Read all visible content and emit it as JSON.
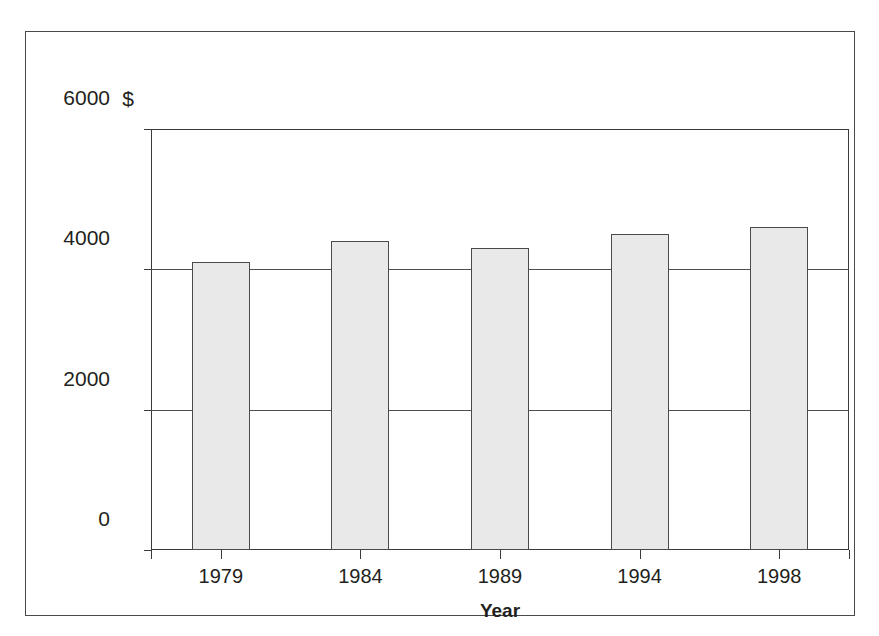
{
  "chart_data": {
    "type": "bar",
    "title": "",
    "subtitle": "",
    "xlabel": "Year",
    "ylabel": "$",
    "categories": [
      "1979",
      "1984",
      "1989",
      "1994",
      "1998"
    ],
    "values": [
      4100,
      4400,
      4300,
      4500,
      4600
    ],
    "series": [
      {
        "name": "",
        "values": [
          4100,
          4400,
          4300,
          4500,
          4600
        ]
      }
    ],
    "ylim": [
      0,
      6000
    ],
    "y_ticks": [
      0,
      2000,
      4000,
      6000
    ],
    "y_tick_labels": [
      "0",
      "2000",
      "4000",
      "6000"
    ],
    "x_tick_labels": [
      "1979",
      "1984",
      "1989",
      "1994",
      "1998"
    ],
    "grid": true,
    "grid_axis": "y",
    "legend": false,
    "legend_position": "none",
    "annotations": [],
    "bar_fill_color": "#e9e9e9",
    "bar_edge_color": "#4a4a4a",
    "axis_color": "#3a3a3a",
    "frame_color": "#4a4a4a",
    "text_color": "#231f20",
    "background_color": "#ffffff"
  }
}
